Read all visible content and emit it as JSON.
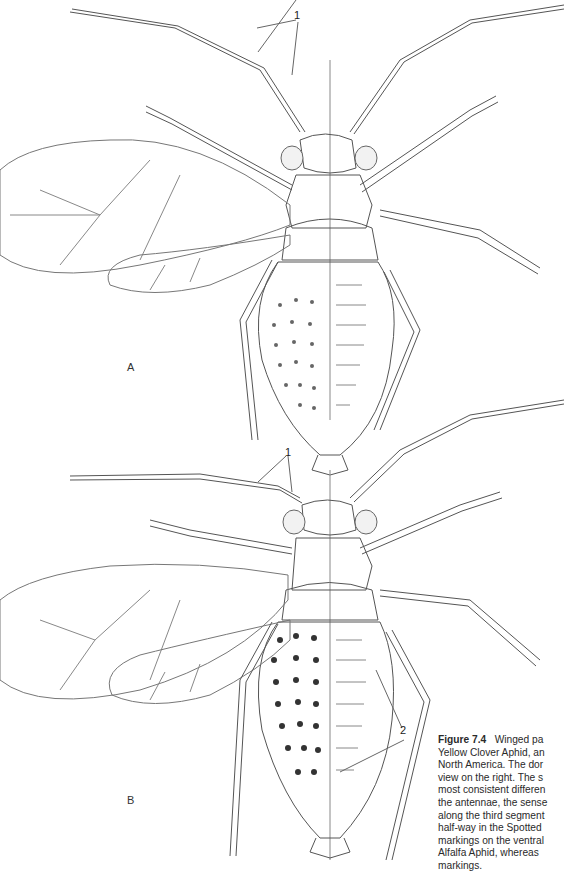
{
  "figure": {
    "panels": [
      {
        "label": "A",
        "callouts": [
          "1"
        ]
      },
      {
        "label": "B",
        "callouts": [
          "1",
          "2"
        ]
      }
    ],
    "caption": {
      "number": "Figure 7.4",
      "lines": [
        "Winged pa",
        "Yellow Clover Aphid, an",
        "North America. The dor",
        "view on the right. The s",
        "most consistent differen",
        "the antennae, the sense",
        "along the third segment",
        "half-way in the Spotted",
        "markings on the ventral",
        "Alfalfa Aphid, whereas",
        "markings."
      ]
    }
  }
}
